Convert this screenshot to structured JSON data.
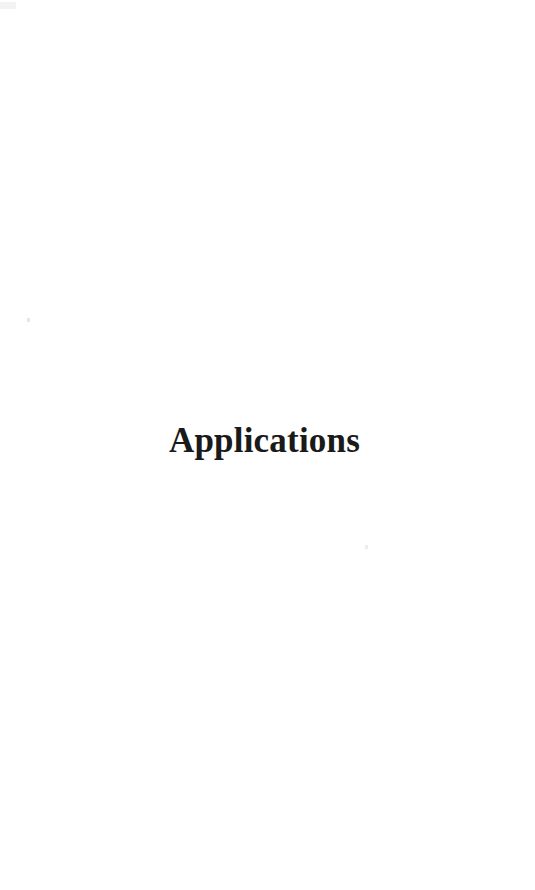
{
  "page": {
    "width": 535,
    "height": 890,
    "background_color": "#ffffff",
    "kind": "scanned-book-part-title-page"
  },
  "content": {
    "part_title": "Applications"
  },
  "style": {
    "text_color": "#1a1a1a",
    "smudge_color": "#f2f2f2",
    "speck_color": "#e6e6e6"
  }
}
